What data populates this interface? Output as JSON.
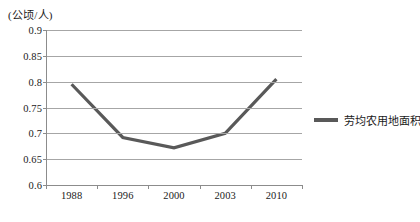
{
  "chart_data": {
    "type": "line",
    "title": "",
    "xlabel": "",
    "ylabel": "(公顷/人)",
    "categories": [
      "1988",
      "1996",
      "2000",
      "2003",
      "2010"
    ],
    "series": [
      {
        "name": "劳均农用地面积",
        "values": [
          0.795,
          0.692,
          0.672,
          0.7,
          0.805
        ],
        "color": "#595959"
      }
    ],
    "ylim": [
      0.6,
      0.9
    ],
    "ytick_labels": [
      "0.9",
      "0.85",
      "0.8",
      "0.75",
      "0.7",
      "0.65",
      "0.6"
    ],
    "ytick_values": [
      0.9,
      0.85,
      0.8,
      0.75,
      0.7,
      0.65,
      0.6
    ],
    "grid": true,
    "grid_color": "#a6a6a6",
    "legend_position": "right"
  },
  "axis": {
    "unit_title": "(公顷/人)"
  },
  "legend": {
    "entries": [
      {
        "label": "劳均农用地面积",
        "color": "#595959"
      }
    ]
  }
}
